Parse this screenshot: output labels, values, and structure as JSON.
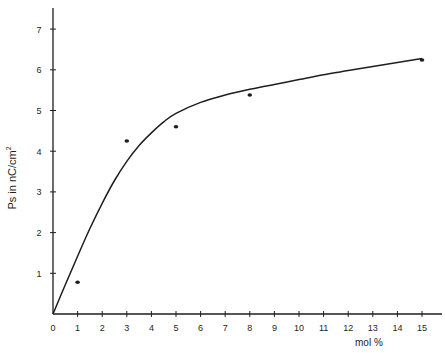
{
  "chart_data": {
    "type": "scatter",
    "title": "",
    "xlabel": "mol %",
    "ylabel": "Ps in nC/cm²",
    "xlim": [
      0,
      15.8
    ],
    "ylim": [
      0,
      7.5
    ],
    "x_ticks": [
      0,
      1,
      2,
      3,
      4,
      5,
      6,
      7,
      8,
      9,
      10,
      11,
      12,
      13,
      14,
      15
    ],
    "y_ticks": [
      1,
      2,
      3,
      4,
      5,
      6,
      7
    ],
    "grid": false,
    "legend": null,
    "series": [
      {
        "name": "measured",
        "type": "scatter",
        "x": [
          1,
          3,
          5,
          8,
          15
        ],
        "y": [
          0.78,
          4.25,
          4.6,
          5.38,
          6.24
        ]
      },
      {
        "name": "fit",
        "type": "line",
        "x": [
          0,
          0.5,
          1,
          1.5,
          2,
          2.5,
          3,
          3.5,
          4,
          4.5,
          5,
          6,
          7,
          8,
          9,
          10,
          11,
          12,
          13,
          14,
          15
        ],
        "y": [
          0,
          0.72,
          1.42,
          2.1,
          2.72,
          3.28,
          3.75,
          4.14,
          4.45,
          4.72,
          4.93,
          5.2,
          5.38,
          5.52,
          5.64,
          5.76,
          5.88,
          5.98,
          6.08,
          6.18,
          6.28
        ]
      }
    ]
  },
  "axes": {
    "x_label": "mol %",
    "y_label": "Ps in nC/cm",
    "y_label_sup": "2"
  },
  "colors": {
    "ink": "#1e1e1e",
    "background": "#ffffff"
  }
}
